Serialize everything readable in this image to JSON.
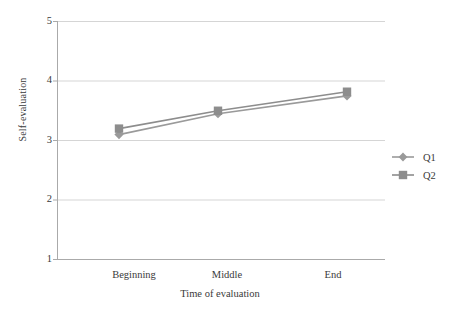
{
  "chart_data": {
    "type": "line",
    "title": "",
    "xlabel": "Time of evaluation",
    "ylabel": "Self-evaluation",
    "categories": [
      "Beginning",
      "Middle",
      "End"
    ],
    "yticks": [
      "5",
      "4",
      "3",
      "2",
      "1"
    ],
    "ylim": [
      1,
      5
    ],
    "grid": true,
    "legend_position": "right",
    "series": [
      {
        "name": "Q1",
        "marker": "diamond",
        "color": "#9a9a9a",
        "values": [
          3.1,
          3.45,
          3.75
        ]
      },
      {
        "name": "Q2",
        "marker": "square",
        "color": "#8d8d8d",
        "values": [
          3.2,
          3.5,
          3.82
        ]
      }
    ]
  },
  "axes": {
    "y_title": "Self-evaluation",
    "x_title": "Time of evaluation",
    "y_tick_labels": [
      "5",
      "4",
      "3",
      "2",
      "1"
    ],
    "x_tick_labels": [
      "Beginning",
      "Middle",
      "End"
    ]
  },
  "legend": {
    "entries": [
      {
        "label": "Q1"
      },
      {
        "label": "Q2"
      }
    ]
  },
  "colors": {
    "series_q1": "#9a9a9a",
    "series_q2": "#8d8d8d",
    "grid": "#d5d5d5",
    "axis": "#aaaaaa",
    "text": "#3a3a3a"
  }
}
